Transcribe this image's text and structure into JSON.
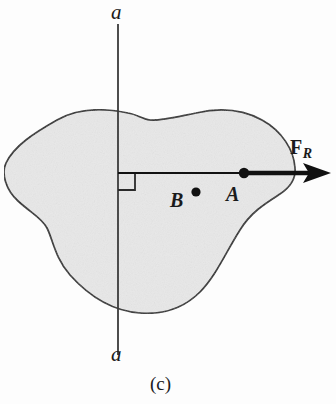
{
  "figure": {
    "caption": "(c)",
    "axis": {
      "top_label": "a",
      "bottom_label": "a",
      "name": "section-line-a-a"
    },
    "points": [
      {
        "id": "A",
        "label": "A",
        "description": "point-on-line-of-action"
      },
      {
        "id": "B",
        "label": "B",
        "description": "point-off-line-of-action"
      }
    ],
    "force": {
      "symbol": "F",
      "subscript": "R",
      "full_label": "F_R",
      "description": "resultant-force-vector",
      "direction": "right"
    },
    "right_angle": {
      "present": true,
      "description": "perpendicular-mark-between-axis-and-force-line"
    },
    "body": {
      "description": "irregular-rigid-body-outline",
      "fill_color": "#e8e8e8",
      "stroke_color": "#2a2a2a"
    },
    "colors": {
      "background": "#fdfdfd",
      "ink": "#1b1b1b",
      "body_fill": "#e8e8e8",
      "body_stroke": "#2a2a2a",
      "axis_line": "#3a3a3a"
    }
  }
}
